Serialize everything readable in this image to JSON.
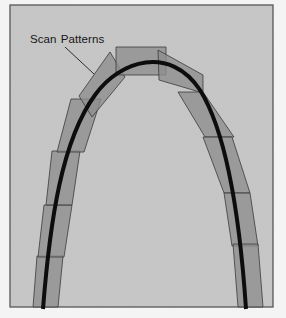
{
  "diagram": {
    "label": {
      "word1": "Scan",
      "word2": "Patterns"
    },
    "colors": {
      "page_background": "#f4f4f4",
      "panel_fill": "#c6c6c6",
      "panel_border": "#4a4a4a",
      "scan_fill": "#8e8e8e",
      "scan_stroke": "#3a3a3a",
      "curve": "#0d0d0d"
    },
    "frame": {
      "x": 10,
      "y": 5,
      "width": 263,
      "height": 302
    },
    "curve_path": "M 43 309 C 50 220, 62 140, 95 95 C 120 60, 170 45, 200 90 C 228 135, 240 220, 246 309",
    "leader_line": {
      "x1": 65,
      "y1": 47,
      "x2": 94,
      "y2": 74
    },
    "scan_patterns": [
      {
        "name": "left-5",
        "points": "37,256 63,256 58,307 33,307"
      },
      {
        "name": "left-4",
        "points": "44,205 72,205 64,257 38,257"
      },
      {
        "name": "left-3",
        "points": "52,151 80,151 72,205 46,205"
      },
      {
        "name": "left-2",
        "points": "71,99 101,99 84,152 57,152"
      },
      {
        "name": "left-1",
        "points": "79,96 110,52 125,77 92,117"
      },
      {
        "name": "top-cap",
        "points": "116,47 166,47 166,75 116,75"
      },
      {
        "name": "right-1",
        "points": "158,50 203,75 203,93 159,80"
      },
      {
        "name": "right-2",
        "points": "178,92 203,92 234,137 205,137"
      },
      {
        "name": "right-3",
        "points": "203,137 232,137 250,193 224,193"
      },
      {
        "name": "right-4",
        "points": "224,193 250,193 258,246 232,246"
      },
      {
        "name": "right-5",
        "points": "233,244 258,244 263,307 238,307"
      }
    ]
  }
}
